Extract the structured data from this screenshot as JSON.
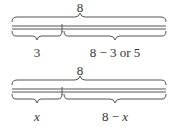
{
  "diagrams": [
    {
      "total_label": "8",
      "left_label": "3",
      "right_label": "8 − 3 or 5"
    },
    {
      "total_label": "8",
      "left_label": "x",
      "right_label": "8 − x",
      "right_label_parts": {
        "number": "8 − ",
        "variable": "x"
      }
    }
  ]
}
